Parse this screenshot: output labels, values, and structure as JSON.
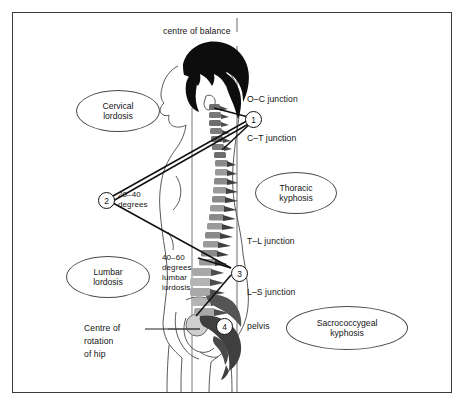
{
  "figure": {
    "title_note": "centre of balance"
  },
  "labels": {
    "centre_of_balance": "centre of balance",
    "oc_junction": "O–C junction",
    "ct_junction": "C–T junction",
    "tl_junction": "T–L junction",
    "ls_junction": "L–S junction",
    "pelvis": "pelvis",
    "centre_of_rotation_hip_line1": "Centre of",
    "centre_of_rotation_hip_line2": "rotation",
    "centre_of_rotation_hip_line3": "of hip",
    "angle_cervical_line1": "20–40",
    "angle_cervical_line2": "degrees",
    "angle_lumbar_line1": "40–60",
    "angle_lumbar_line2": "degrees",
    "angle_lumbar_line3": "lumbar",
    "angle_lumbar_line4": "lordosis"
  },
  "callouts": [
    {
      "id": "cervical-lordosis",
      "line1": "Cervical",
      "line2": "lordosis"
    },
    {
      "id": "thoracic-kyphosis",
      "line1": "Thoracic",
      "line2": "kyphosis"
    },
    {
      "id": "lumbar-lordosis",
      "line1": "Lumbar",
      "line2": "lordosis"
    },
    {
      "id": "sacrococcygeal-kyphosis",
      "line1": "Sacrococcygeal",
      "line2": "kyphosis"
    }
  ],
  "markers": [
    {
      "number": "1",
      "name": "marker-1-cervical-apex"
    },
    {
      "number": "2",
      "name": "marker-2-angle-vertex"
    },
    {
      "number": "3",
      "name": "marker-3-lumbosacral-apex"
    },
    {
      "number": "4",
      "name": "marker-4-pelvis"
    }
  ],
  "colors": {
    "border": "#3a3a3a",
    "ink": "#141414",
    "line": "#111111",
    "hair": "#0d0d0d",
    "bone_dark": "#4d4d4d",
    "bone_mid": "#8a8a8a",
    "bone_light": "#b8b8b8",
    "skin_outline": "#5a5a5a",
    "reference_line": "#6d6d6d",
    "background": "#ffffff"
  }
}
